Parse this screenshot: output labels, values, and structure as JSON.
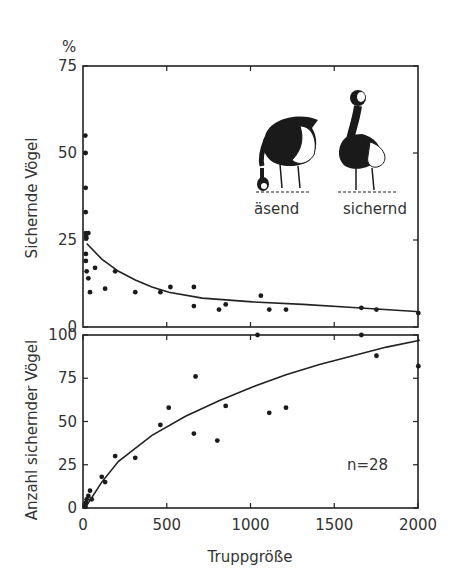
{
  "chart_data": [
    {
      "type": "scatter",
      "title": "",
      "ylabel": "Sichernde Vögel",
      "yunit": "%",
      "xlabel": "Truppgröße",
      "xlim": [
        0,
        2000
      ],
      "ylim": [
        0,
        75
      ],
      "yticks": [
        "0",
        "25",
        "50",
        "75"
      ],
      "grid": false,
      "illustration_labels": [
        "äsend",
        "sichernd"
      ],
      "points": [
        [
          2,
          55
        ],
        [
          3,
          50
        ],
        [
          4,
          40
        ],
        [
          4,
          33
        ],
        [
          5,
          27
        ],
        [
          6,
          26
        ],
        [
          8,
          25.5
        ],
        [
          20,
          27
        ],
        [
          5,
          21
        ],
        [
          5,
          19
        ],
        [
          10,
          16
        ],
        [
          20,
          14
        ],
        [
          30,
          10
        ],
        [
          60,
          17
        ],
        [
          120,
          11
        ],
        [
          180,
          16
        ],
        [
          300,
          10
        ],
        [
          450,
          10
        ],
        [
          510,
          11.5
        ],
        [
          650,
          11.5
        ],
        [
          650,
          6
        ],
        [
          800,
          5
        ],
        [
          840,
          6.5
        ],
        [
          1050,
          9
        ],
        [
          1100,
          5
        ],
        [
          1200,
          5
        ],
        [
          1650,
          5.5
        ],
        [
          1740,
          5
        ],
        [
          1990,
          4
        ]
      ],
      "fit_curve": {
        "x": [
          10,
          100,
          200,
          300,
          400,
          500,
          700,
          1000,
          1300,
          1600,
          2000
        ],
        "y": [
          24,
          19.5,
          16,
          13.5,
          11.5,
          10,
          8.3,
          7.2,
          6.5,
          5.6,
          4.4
        ]
      }
    },
    {
      "type": "scatter",
      "title": "",
      "ylabel": "Anzahl sichernder Vögel",
      "xlabel": "Truppgröße",
      "xlim": [
        0,
        2000
      ],
      "ylim": [
        0,
        100
      ],
      "xticks": [
        "0",
        "500",
        "1000",
        "1500",
        "2000"
      ],
      "yticks": [
        "0",
        "25",
        "50",
        "75",
        "100"
      ],
      "annotation": "n=28",
      "grid": false,
      "points": [
        [
          2,
          1
        ],
        [
          5,
          3
        ],
        [
          10,
          5
        ],
        [
          20,
          7
        ],
        [
          30,
          10
        ],
        [
          40,
          5
        ],
        [
          100,
          18
        ],
        [
          120,
          15
        ],
        [
          180,
          30
        ],
        [
          300,
          29
        ],
        [
          450,
          48
        ],
        [
          500,
          58
        ],
        [
          650,
          43
        ],
        [
          660,
          76
        ],
        [
          790,
          39
        ],
        [
          840,
          59
        ],
        [
          1030,
          100
        ],
        [
          1100,
          55
        ],
        [
          1200,
          58
        ],
        [
          1650,
          100
        ],
        [
          1740,
          88
        ],
        [
          1990,
          82
        ]
      ],
      "fit_curve": {
        "x": [
          0,
          100,
          200,
          400,
          600,
          800,
          1000,
          1200,
          1400,
          1600,
          1800,
          2000
        ],
        "y": [
          0,
          15,
          27,
          42,
          53,
          62,
          70,
          77,
          83,
          88,
          93,
          97
        ]
      }
    }
  ],
  "labels": {
    "top_unit": "%",
    "top_ylabel": "Sichernde Vögel",
    "bottom_ylabel": "Anzahl sichernder Vögel",
    "xlabel": "Truppgröße",
    "annotation": "n=28",
    "goose_left": "äsend",
    "goose_right": "sichernd",
    "top_yticks": [
      "0",
      "25",
      "50",
      "75"
    ],
    "bottom_yticks": [
      "0",
      "25",
      "50",
      "75",
      "100"
    ],
    "xticks": [
      "0",
      "500",
      "1000",
      "1500",
      "2000"
    ]
  }
}
